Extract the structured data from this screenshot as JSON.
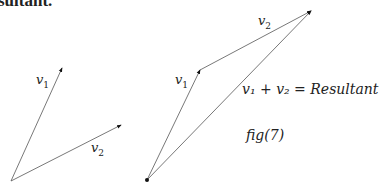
{
  "top_text": "sultant.",
  "left_figure": {
    "v1_label": "v",
    "v1_sub": "1",
    "v2_label": "v",
    "v2_sub": "2"
  },
  "right_figure": {
    "v1_label": "v",
    "v1_sub": "1",
    "v2_label": "v",
    "v2_sub": "2",
    "resultant_label": "v₁ + v₂ = Resultant",
    "caption": "fig(7)"
  }
}
